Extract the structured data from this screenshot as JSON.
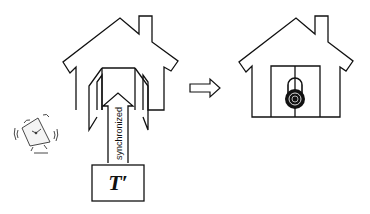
{
  "diagram": {
    "arrow_label": "synchronized",
    "thread_label": "T′",
    "elements": [
      {
        "id": "alarm-clock",
        "icon": "alarm-clock-icon"
      },
      {
        "id": "house-open",
        "icon": "house-icon",
        "state": "open-doors"
      },
      {
        "id": "transition-arrow",
        "icon": "right-arrow-icon"
      },
      {
        "id": "house-locked",
        "icon": "house-icon",
        "state": "locked"
      },
      {
        "id": "padlock",
        "icon": "combination-lock-icon"
      }
    ]
  },
  "colors": {
    "stroke": "#111111",
    "background": "#ffffff"
  }
}
